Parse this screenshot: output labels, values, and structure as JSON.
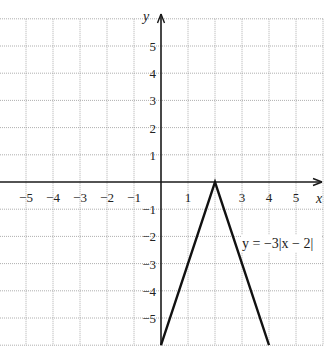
{
  "chart_data": {
    "type": "line",
    "title": "",
    "xlabel": "x",
    "ylabel": "y",
    "xlim": [
      -6,
      6
    ],
    "ylim": [
      -6,
      6
    ],
    "grid": true,
    "x_ticks": [
      -5,
      -4,
      -3,
      -2,
      -1,
      1,
      3,
      4,
      5
    ],
    "x_tick_labels": [
      "−5",
      "−4",
      "−3",
      "−2",
      "−1",
      "1",
      "3",
      "4",
      "5"
    ],
    "y_ticks": [
      5,
      4,
      3,
      2,
      1,
      -1,
      -2,
      -3,
      -4,
      -5
    ],
    "y_tick_labels": [
      "5",
      "4",
      "3",
      "2",
      "1",
      "−1",
      "−2",
      "−3",
      "−4",
      "−5"
    ],
    "series": [
      {
        "name": "y = −3|x − 2|",
        "x": [
          0,
          2,
          4
        ],
        "y": [
          -6,
          0,
          -6
        ]
      }
    ],
    "annotations": [
      {
        "text": "y = −3|x − 2|",
        "x": 3.0,
        "y": -2.4
      }
    ]
  },
  "labels": {
    "x_axis": "x",
    "y_axis": "y",
    "equation": "y = −3|x − 2|"
  }
}
